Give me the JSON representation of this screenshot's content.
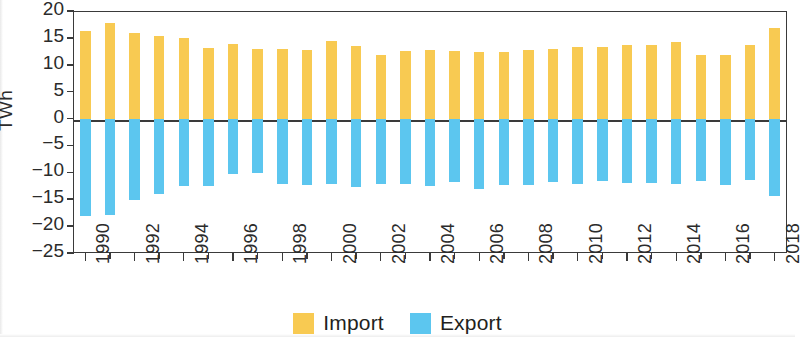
{
  "chart_data": {
    "type": "bar",
    "title": "",
    "subtitle": "",
    "xlabel": "",
    "ylabel": "TWh",
    "ylim": [
      -25,
      20
    ],
    "yticks": [
      20,
      15,
      10,
      5,
      0,
      -5,
      -10,
      -15,
      -20,
      -25
    ],
    "ytick_labels": [
      "20",
      "15",
      "10",
      "5",
      "0",
      "−5",
      "−10",
      "−15",
      "−20",
      "−25"
    ],
    "grid": false,
    "legend_position": "bottom-center",
    "orientation": "vertical",
    "bar_mode": "diverging",
    "categories": [
      "1990",
      "1991",
      "1992",
      "1993",
      "1994",
      "1995",
      "1996",
      "1997",
      "1998",
      "1999",
      "2000",
      "2001",
      "2002",
      "2003",
      "2004",
      "2005",
      "2006",
      "2007",
      "2008",
      "2009",
      "2010",
      "2011",
      "2012",
      "2013",
      "2014",
      "2015",
      "2016",
      "2017",
      "2018"
    ],
    "xtick_labels": [
      "1990",
      "1992",
      "1994",
      "1996",
      "1998",
      "2000",
      "2002",
      "2004",
      "2006",
      "2008",
      "2010",
      "2012",
      "2014",
      "2016",
      "2018"
    ],
    "series": [
      {
        "name": "Import",
        "color": "#f8ca52",
        "values": [
          16.3,
          17.8,
          15.9,
          15.3,
          14.9,
          13.2,
          13.8,
          12.9,
          12.9,
          12.8,
          14.5,
          13.4,
          11.9,
          12.6,
          12.8,
          12.6,
          12.3,
          12.4,
          12.7,
          13.0,
          13.3,
          13.3,
          13.7,
          13.6,
          14.2,
          11.9,
          11.9,
          13.6,
          16.8
        ]
      },
      {
        "name": "Export",
        "color": "#5cc6ef",
        "values": [
          -18.2,
          -17.9,
          -15.2,
          -14.1,
          -12.6,
          -12.6,
          -10.4,
          -10.2,
          -12.2,
          -12.4,
          -12.1,
          -12.8,
          -12.2,
          -12.2,
          -12.5,
          -11.8,
          -13.1,
          -12.4,
          -12.3,
          -11.8,
          -12.1,
          -11.7,
          -11.9,
          -12.0,
          -12.1,
          -11.7,
          -12.4,
          -11.4,
          -14.4
        ]
      }
    ]
  },
  "legend": {
    "items": [
      {
        "label": "Import",
        "color": "#f8ca52"
      },
      {
        "label": "Export",
        "color": "#5cc6ef"
      }
    ]
  },
  "axes": {
    "y_title": "TWh"
  }
}
